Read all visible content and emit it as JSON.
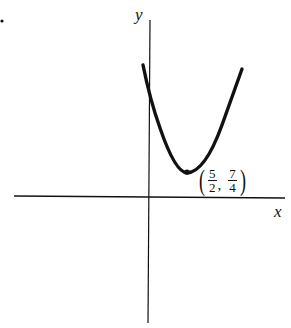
{
  "figure": {
    "x_axis_label": "x",
    "y_axis_label": "y",
    "curve": "parabola opening upward",
    "vertex_label": {
      "x_num": "5",
      "x_den": "2",
      "y_num": "7",
      "y_den": "4",
      "sep": ","
    },
    "colors": {
      "ink": "#111111",
      "background": "#ffffff"
    }
  }
}
